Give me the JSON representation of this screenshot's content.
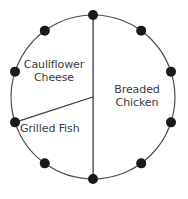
{
  "chart_data": {
    "type": "pie",
    "title": "",
    "subtitle": "",
    "xlabel": "",
    "ylabel": "",
    "legend_position": "none",
    "grid": false,
    "center": {
      "x": 93,
      "y": 97
    },
    "radius": 82,
    "start_angle_deg": -90,
    "marker_count": 10,
    "marker_step_deg": 36,
    "marker_radius_px": 5,
    "marker_color": "#1a1a1a",
    "outline_color": "#4d4d4d",
    "outline_width": 1.2,
    "slice_color": "#ffffff",
    "label_color": "#3b3b3b",
    "categories": [
      "Breaded Chicken",
      "Cauliflower Cheese",
      "Grilled Fish"
    ],
    "values": [
      5,
      3,
      2
    ],
    "percent": [
      50,
      30,
      20
    ],
    "angles_deg": [
      180,
      108,
      72
    ],
    "slices": [
      {
        "name": "Breaded Chicken",
        "label": "Breaded\nChicken",
        "value": 5,
        "percent": 50,
        "angle_deg": 180,
        "start_deg": -90,
        "end_deg": 90,
        "color": "#ffffff",
        "markers_on_arc": 5
      },
      {
        "name": "Cauliflower Cheese",
        "label": "Cauliflower\nCheese",
        "value": 3,
        "percent": 30,
        "angle_deg": 108,
        "start_deg": 162,
        "end_deg": 270,
        "color": "#ffffff",
        "markers_on_arc": 3
      },
      {
        "name": "Grilled Fish",
        "label": "Grilled Fish",
        "value": 2,
        "percent": 20,
        "angle_deg": 72,
        "start_deg": 90,
        "end_deg": 162,
        "color": "#ffffff",
        "markers_on_arc": 2
      }
    ],
    "markers": [
      {
        "index": 0,
        "angle_deg": -90,
        "x": 93,
        "y": 15
      },
      {
        "index": 1,
        "angle_deg": -54,
        "x": 141,
        "y": 31
      },
      {
        "index": 2,
        "angle_deg": -18,
        "x": 171,
        "y": 72
      },
      {
        "index": 3,
        "angle_deg": 18,
        "x": 171,
        "y": 122
      },
      {
        "index": 4,
        "angle_deg": 54,
        "x": 141,
        "y": 163
      },
      {
        "index": 5,
        "angle_deg": 90,
        "x": 93,
        "y": 179
      },
      {
        "index": 6,
        "angle_deg": 126,
        "x": 45,
        "y": 163
      },
      {
        "index": 7,
        "angle_deg": 162,
        "x": 15,
        "y": 122
      },
      {
        "index": 8,
        "angle_deg": 198,
        "x": 15,
        "y": 72
      },
      {
        "index": 9,
        "angle_deg": 234,
        "x": 45,
        "y": 31
      }
    ]
  }
}
